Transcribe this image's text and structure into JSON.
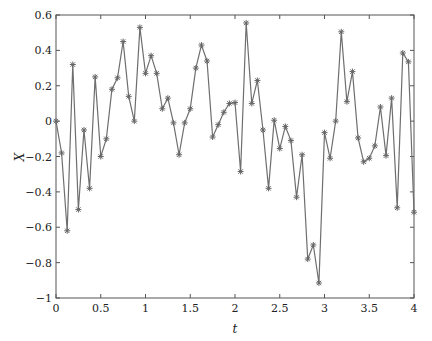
{
  "chart_data": {
    "type": "line",
    "title": "",
    "xlabel": "t",
    "ylabel": "X",
    "xlim": [
      0,
      4
    ],
    "ylim": [
      -1,
      0.6
    ],
    "grid": false,
    "legend": null,
    "marker": "star",
    "line_color": "#6e6e6e",
    "x_ticks": [
      0,
      0.5,
      1,
      1.5,
      2,
      2.5,
      3,
      3.5,
      4
    ],
    "x_tick_labels": [
      "0",
      "0.5",
      "1",
      "1.5",
      "2",
      "2.5",
      "3",
      "3.5",
      "4"
    ],
    "y_ticks": [
      0.6,
      0.4,
      0.2,
      0,
      -0.2,
      -0.4,
      -0.6,
      -0.8,
      -1
    ],
    "y_tick_labels": [
      "0.6",
      "0.4",
      "0.2",
      "0",
      "−0.2",
      "−0.4",
      "−0.6",
      "−0.8",
      "−1"
    ],
    "x_step": 0.0625,
    "series": [
      {
        "name": "X",
        "values": [
          0,
          -0.18,
          -0.62,
          0.32,
          -0.5,
          -0.05,
          -0.38,
          0.25,
          -0.2,
          -0.1,
          0.18,
          0.245,
          0.45,
          0.14,
          0.0,
          0.53,
          0.27,
          0.37,
          0.27,
          0.07,
          0.13,
          -0.01,
          -0.19,
          -0.01,
          0.07,
          0.3,
          0.43,
          0.34,
          -0.09,
          -0.02,
          0.05,
          0.1,
          0.105,
          -0.285,
          0.555,
          0.1,
          0.23,
          -0.05,
          -0.38,
          0.005,
          -0.155,
          -0.03,
          -0.11,
          -0.43,
          -0.19,
          -0.78,
          -0.7,
          -0.915,
          -0.065,
          -0.21,
          0.0,
          0.505,
          0.11,
          0.28,
          -0.095,
          -0.23,
          -0.21,
          -0.14,
          0.08,
          -0.195,
          0.13,
          -0.49,
          0.385,
          0.335,
          -0.515
        ]
      }
    ]
  }
}
